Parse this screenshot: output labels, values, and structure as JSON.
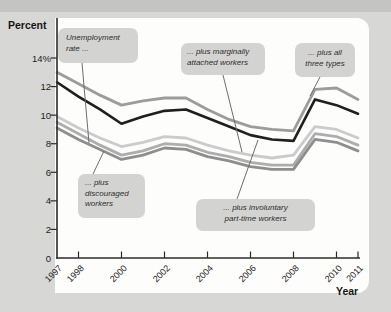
{
  "figure": {
    "y_axis_title": "Percent",
    "x_axis_title": "Year"
  },
  "callouts": {
    "unemployment": "Unemployment\nrate ...",
    "marginally": "... plus marginally\nattached workers",
    "all_three": "... plus all\nthree types",
    "discouraged": "... plus\ndiscouraged\nworkers",
    "involuntary": "... plus involuntary\npart-time workers"
  },
  "colors": {
    "page_background": "#d7d7d5",
    "top_strip": "#c4c4c2",
    "panel_background": "#fdfdfc",
    "callout_box": "#d3d3d1",
    "axis": "#2b2b2b",
    "pointer_line": "#6e6e6e",
    "text": "#1e1e1e"
  },
  "chart_data": {
    "type": "line",
    "xlabel": "Year",
    "ylabel": "Percent",
    "ylim": [
      0,
      14
    ],
    "grid": false,
    "legend_position": "none (series labeled by callout boxes)",
    "x": [
      1997,
      1998,
      1999,
      2000,
      2001,
      2002,
      2003,
      2004,
      2005,
      2006,
      2007,
      2008,
      2009,
      2010,
      2011
    ],
    "y_ticks": [
      {
        "label": "14%",
        "value": 14
      },
      {
        "label": "12",
        "value": 12
      },
      {
        "label": "10",
        "value": 10
      },
      {
        "label": "8",
        "value": 8
      },
      {
        "label": "6",
        "value": 6
      },
      {
        "label": "4",
        "value": 4
      },
      {
        "label": "2",
        "value": 2
      },
      {
        "label": "0",
        "value": 0
      }
    ],
    "x_ticks": [
      {
        "label": "1997",
        "year": 1997
      },
      {
        "label": "1998",
        "year": 1998
      },
      {
        "label": "2000",
        "year": 2000
      },
      {
        "label": "2002",
        "year": 2002
      },
      {
        "label": "2004",
        "year": 2004
      },
      {
        "label": "2006",
        "year": 2006
      },
      {
        "label": "2008",
        "year": 2008
      },
      {
        "label": "2010",
        "year": 2010
      },
      {
        "label": "2011",
        "year": 2011
      }
    ],
    "series": [
      {
        "name": "Unemployment rate ...",
        "color": "#8e8e8e",
        "values": [
          9.1,
          8.3,
          7.6,
          6.9,
          7.2,
          7.7,
          7.6,
          7.1,
          6.8,
          6.4,
          6.2,
          6.2,
          8.3,
          8.1,
          7.5
        ]
      },
      {
        "name": "... plus discouraged workers",
        "color": "#adadad",
        "values": [
          9.5,
          8.7,
          7.9,
          7.2,
          7.5,
          8.0,
          7.9,
          7.4,
          7.1,
          6.7,
          6.5,
          6.5,
          8.7,
          8.5,
          7.9
        ]
      },
      {
        "name": "... plus marginally attached workers",
        "color": "#cbcbcb",
        "values": [
          9.9,
          9.1,
          8.4,
          7.8,
          8.1,
          8.5,
          8.4,
          7.9,
          7.5,
          7.2,
          7.0,
          7.2,
          9.2,
          9.0,
          8.4
        ]
      },
      {
        "name": "... plus involuntary part-time workers",
        "color": "#1f1f1f",
        "values": [
          12.3,
          11.3,
          10.4,
          9.4,
          9.9,
          10.3,
          10.4,
          9.8,
          9.2,
          8.6,
          8.3,
          8.2,
          11.1,
          10.7,
          10.1
        ]
      },
      {
        "name": "... plus all three types",
        "color": "#9c9c9c",
        "values": [
          13.0,
          12.2,
          11.4,
          10.7,
          11.0,
          11.2,
          11.2,
          10.4,
          9.7,
          9.2,
          9.0,
          8.9,
          11.8,
          11.9,
          11.1
        ]
      }
    ]
  }
}
